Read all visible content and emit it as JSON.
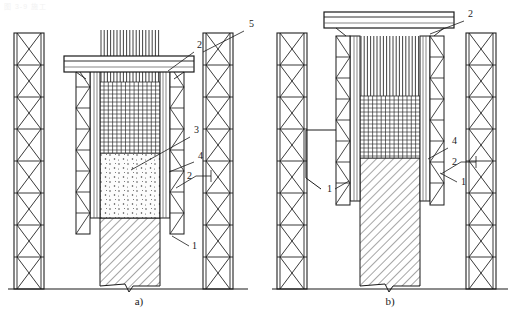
{
  "figure": {
    "watermark": "图 3-9  施工",
    "panels": [
      {
        "id": "panel-a",
        "caption": "a)",
        "caption_x": 139,
        "caption_y": 305,
        "origin_x": 0,
        "ground_y": 289,
        "ground_x1": 8,
        "ground_x2": 248,
        "callouts": [
          {
            "text": "5",
            "x": 249,
            "y": 27,
            "lx1": 244,
            "ly1": 31,
            "lx2": 203,
            "ly2": 52
          },
          {
            "text": "2",
            "x": 197,
            "y": 48,
            "lx1": 194,
            "ly1": 52,
            "lx2": 168,
            "ly2": 71
          },
          {
            "text": "3",
            "x": 194,
            "y": 133,
            "lx1": 190,
            "ly1": 137,
            "lx2": 131,
            "ly2": 170
          },
          {
            "text": "4",
            "x": 198,
            "y": 159,
            "lx1": 194,
            "ly1": 162,
            "lx2": 169,
            "ly2": 172
          },
          {
            "text": "2",
            "x": 190,
            "y": 178,
            "lx1": 196,
            "ly1": 176,
            "lx2": 211,
            "ly2": 176
          },
          {
            "text": "1",
            "x": 192,
            "y": 249,
            "lx1": 189,
            "ly1": 246,
            "lx2": 172,
            "ly2": 236
          }
        ]
      },
      {
        "id": "panel-b",
        "caption": "b)",
        "caption_x": 390,
        "caption_y": 305,
        "origin_x": 264,
        "ground_y": 289,
        "ground_x1": 272,
        "ground_x2": 508,
        "callouts": [
          {
            "text": "2",
            "x": 468,
            "y": 17,
            "lx1": 464,
            "ly1": 21,
            "lx2": 430,
            "ly2": 34
          },
          {
            "text": "4",
            "x": 452,
            "y": 144,
            "lx1": 448,
            "ly1": 148,
            "lx2": 428,
            "ly2": 159
          },
          {
            "text": "2",
            "x": 455,
            "y": 164,
            "lx1": 461,
            "ly1": 162,
            "lx2": 476,
            "ly2": 162
          },
          {
            "text": "1",
            "x": 461,
            "y": 185,
            "lx1": 457,
            "ly1": 182,
            "lx2": 440,
            "ly2": 173
          },
          {
            "text": "1",
            "x": 331,
            "y": 192,
            "lx1": 335,
            "ly1": 189,
            "lx2": 349,
            "ly2": 181
          }
        ]
      }
    ],
    "colors": {
      "line": "#1a1a1a",
      "line_light": "#555555",
      "concrete_fresh_fill": "#fbfbfb",
      "concrete_fresh_dot": "#333333",
      "concrete_hard_hatch": "#3a3a3a",
      "steel": "#2b2b2b",
      "tower": "#222222"
    },
    "geometry": {
      "tower_panel_count": 8,
      "rebar_vertical_count": 19,
      "mesh_horizontal_count": 17,
      "mesh_vertical_count": 13
    }
  }
}
